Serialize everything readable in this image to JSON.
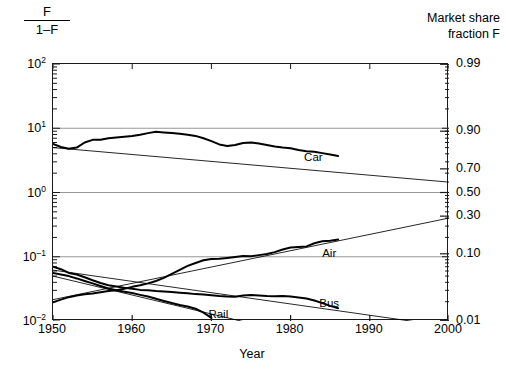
{
  "figure": {
    "left_axis_title_numerator": "F",
    "left_axis_title_denominator": "1–F",
    "right_axis_title_line1": "Market share",
    "right_axis_title_line2": "fraction F",
    "x_axis_title": "Year",
    "background_color": "#ffffff",
    "line_color": "#000000",
    "gridline_color": "#8a8a8a"
  },
  "chart_data": {
    "type": "line",
    "title": "",
    "subtitle": "",
    "xlabel": "Year",
    "ylabel": "F / (1–F)",
    "ylabel_right": "Market share fraction F",
    "grid": true,
    "legend_position": "inline-annotations",
    "xlim": [
      1950,
      2000
    ],
    "xticks": [
      1950,
      1960,
      1970,
      1980,
      1990,
      2000
    ],
    "xtick_labels": [
      "1950",
      "1960",
      "1970",
      "1980",
      "1990",
      "2000"
    ],
    "yscale": "log-odds",
    "ylim_odds": [
      0.01,
      100
    ],
    "yticks_left_odds": [
      0.01,
      0.1,
      1,
      10,
      100
    ],
    "ytick_labels_left": [
      "10-2",
      "10-1",
      "100",
      "101",
      "102"
    ],
    "ytick_labels_left_display": [
      "10⁻²",
      "10⁻¹",
      "10⁰",
      "10¹",
      "10²"
    ],
    "yticks_right_fraction": [
      0.01,
      0.1,
      0.3,
      0.5,
      0.7,
      0.9,
      0.99
    ],
    "ytick_labels_right": [
      "0.01",
      "0.10",
      "0.30",
      "0.50",
      "0.70",
      "0.90",
      "0.99"
    ],
    "gridlines_odds": [
      100,
      10,
      1,
      0.1,
      0.01
    ],
    "annotations": [
      {
        "text": "Car",
        "x": 1983,
        "odds": 3.3
      },
      {
        "text": "Air",
        "x": 1985,
        "odds": 0.105
      },
      {
        "text": "Bus",
        "x": 1985,
        "odds": 0.0175
      },
      {
        "text": "Rail",
        "x": 1971,
        "odds": 0.0118
      }
    ],
    "series": [
      {
        "name": "Car",
        "style": "data",
        "x": [
          1950,
          1951,
          1952,
          1953,
          1954,
          1955,
          1956,
          1957,
          1958,
          1959,
          1960,
          1961,
          1962,
          1963,
          1964,
          1965,
          1966,
          1967,
          1968,
          1969,
          1970,
          1971,
          1972,
          1973,
          1974,
          1975,
          1976,
          1977,
          1978,
          1979,
          1980,
          1981,
          1982,
          1983,
          1984,
          1985,
          1986
        ],
        "odds": [
          5.7,
          5.1,
          4.8,
          5.0,
          6.0,
          6.6,
          6.6,
          7.0,
          7.2,
          7.4,
          7.6,
          7.9,
          8.4,
          8.8,
          8.6,
          8.4,
          8.2,
          7.9,
          7.6,
          7.0,
          6.3,
          5.6,
          5.3,
          5.5,
          5.9,
          6.0,
          5.8,
          5.5,
          5.2,
          5.0,
          4.9,
          4.6,
          4.4,
          4.3,
          4.1,
          3.9,
          3.7
        ]
      },
      {
        "name": "Car",
        "style": "fit",
        "x": [
          1950,
          2000
        ],
        "odds": [
          5.0,
          1.45
        ]
      },
      {
        "name": "Air",
        "style": "data",
        "x": [
          1950,
          1951,
          1952,
          1953,
          1954,
          1955,
          1956,
          1957,
          1958,
          1959,
          1960,
          1961,
          1962,
          1963,
          1964,
          1965,
          1966,
          1967,
          1968,
          1969,
          1970,
          1971,
          1972,
          1973,
          1974,
          1975,
          1976,
          1977,
          1978,
          1979,
          1980,
          1981,
          1982,
          1983,
          1984,
          1985,
          1986
        ],
        "odds": [
          0.0195,
          0.0215,
          0.0235,
          0.025,
          0.026,
          0.0268,
          0.028,
          0.0292,
          0.03,
          0.0318,
          0.034,
          0.036,
          0.0385,
          0.042,
          0.047,
          0.054,
          0.0625,
          0.072,
          0.08,
          0.088,
          0.092,
          0.093,
          0.096,
          0.0995,
          0.103,
          0.102,
          0.106,
          0.11,
          0.118,
          0.13,
          0.139,
          0.142,
          0.145,
          0.162,
          0.174,
          0.178,
          0.185
        ]
      },
      {
        "name": "Air",
        "style": "fit",
        "x": [
          1950,
          2000
        ],
        "odds": [
          0.0215,
          0.4
        ]
      },
      {
        "name": "Bus",
        "style": "data",
        "x": [
          1950,
          1951,
          1952,
          1953,
          1954,
          1955,
          1956,
          1957,
          1958,
          1959,
          1960,
          1961,
          1962,
          1963,
          1964,
          1965,
          1966,
          1967,
          1968,
          1969,
          1970,
          1971,
          1972,
          1973,
          1974,
          1975,
          1976,
          1977,
          1978,
          1979,
          1980,
          1981,
          1982,
          1983,
          1984,
          1985,
          1986
        ],
        "odds": [
          0.07,
          0.064,
          0.056,
          0.053,
          0.048,
          0.043,
          0.039,
          0.036,
          0.0345,
          0.033,
          0.0318,
          0.0305,
          0.03,
          0.0292,
          0.0288,
          0.0282,
          0.0276,
          0.027,
          0.0262,
          0.0258,
          0.0252,
          0.0245,
          0.024,
          0.0238,
          0.025,
          0.0255,
          0.025,
          0.0245,
          0.0242,
          0.0244,
          0.024,
          0.0232,
          0.0224,
          0.0208,
          0.019,
          0.0172,
          0.0158
        ]
      },
      {
        "name": "Bus",
        "style": "fit",
        "x": [
          1950,
          2000
        ],
        "odds": [
          0.062,
          0.0082
        ]
      },
      {
        "name": "Rail",
        "style": "data",
        "x": [
          1950,
          1951,
          1952,
          1953,
          1954,
          1955,
          1956,
          1957,
          1958,
          1959,
          1960,
          1961,
          1962,
          1963,
          1964,
          1965,
          1966,
          1967,
          1968,
          1969,
          1970
        ],
        "odds": [
          0.056,
          0.053,
          0.05,
          0.046,
          0.042,
          0.0385,
          0.035,
          0.032,
          0.03,
          0.0285,
          0.0272,
          0.0255,
          0.024,
          0.0222,
          0.0205,
          0.019,
          0.0178,
          0.0168,
          0.0155,
          0.0135,
          0.0112
        ]
      },
      {
        "name": "Rail",
        "style": "fit",
        "x": [
          1950,
          1974
        ],
        "odds": [
          0.05,
          0.0098
        ]
      }
    ]
  }
}
